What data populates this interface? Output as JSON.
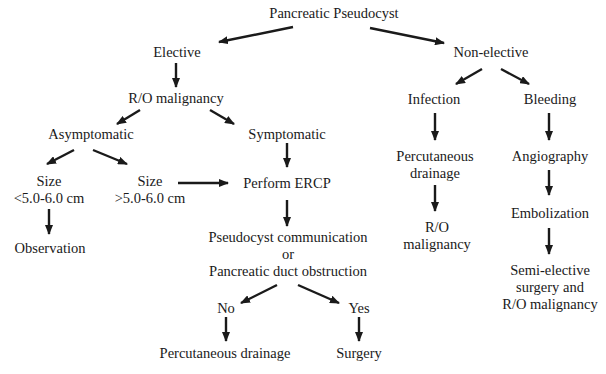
{
  "diagram": {
    "title": "Pancreatic Pseudocyst",
    "nodes": {
      "root": {
        "lines": [
          "Pancreatic Pseudocyst"
        ]
      },
      "elective": {
        "lines": [
          "Elective"
        ]
      },
      "non_elective": {
        "lines": [
          "Non-elective"
        ]
      },
      "ro_malignancy_1": {
        "lines": [
          "R/O malignancy"
        ]
      },
      "asymptomatic": {
        "lines": [
          "Asymptomatic"
        ]
      },
      "symptomatic": {
        "lines": [
          "Symptomatic"
        ]
      },
      "size_small": {
        "lines": [
          "Size",
          "<5.0-6.0 cm"
        ]
      },
      "size_large": {
        "lines": [
          "Size",
          ">5.0-6.0 cm"
        ]
      },
      "observation": {
        "lines": [
          "Observation"
        ]
      },
      "perform_ercp": {
        "lines": [
          "Perform ERCP"
        ]
      },
      "communication": {
        "lines": [
          "Pseudocyst communication",
          "or",
          "Pancreatic duct obstruction"
        ]
      },
      "no": {
        "lines": [
          "No"
        ]
      },
      "yes": {
        "lines": [
          "Yes"
        ]
      },
      "perc_drainage_2": {
        "lines": [
          "Percutaneous drainage"
        ]
      },
      "surgery": {
        "lines": [
          "Surgery"
        ]
      },
      "infection": {
        "lines": [
          "Infection"
        ]
      },
      "bleeding": {
        "lines": [
          "Bleeding"
        ]
      },
      "perc_drainage_1": {
        "lines": [
          "Percutaneous",
          "drainage"
        ]
      },
      "angiography": {
        "lines": [
          "Angiography"
        ]
      },
      "ro_malignancy_2": {
        "lines": [
          "R/O",
          "malignancy"
        ]
      },
      "embolization": {
        "lines": [
          "Embolization"
        ]
      },
      "semi_elective": {
        "lines": [
          "Semi-elective",
          "surgery and",
          "R/O malignancy"
        ]
      }
    },
    "edges": [
      {
        "from": "root",
        "to": "elective"
      },
      {
        "from": "root",
        "to": "non_elective"
      },
      {
        "from": "elective",
        "to": "ro_malignancy_1"
      },
      {
        "from": "ro_malignancy_1",
        "to": "asymptomatic"
      },
      {
        "from": "ro_malignancy_1",
        "to": "symptomatic"
      },
      {
        "from": "asymptomatic",
        "to": "size_small"
      },
      {
        "from": "asymptomatic",
        "to": "size_large"
      },
      {
        "from": "size_small",
        "to": "observation"
      },
      {
        "from": "size_large",
        "to": "perform_ercp"
      },
      {
        "from": "symptomatic",
        "to": "perform_ercp"
      },
      {
        "from": "perform_ercp",
        "to": "communication"
      },
      {
        "from": "communication",
        "to": "no"
      },
      {
        "from": "communication",
        "to": "yes"
      },
      {
        "from": "no",
        "to": "perc_drainage_2"
      },
      {
        "from": "yes",
        "to": "surgery"
      },
      {
        "from": "non_elective",
        "to": "infection"
      },
      {
        "from": "non_elective",
        "to": "bleeding"
      },
      {
        "from": "infection",
        "to": "perc_drainage_1"
      },
      {
        "from": "perc_drainage_1",
        "to": "ro_malignancy_2"
      },
      {
        "from": "bleeding",
        "to": "angiography"
      },
      {
        "from": "angiography",
        "to": "embolization"
      },
      {
        "from": "embolization",
        "to": "semi_elective"
      }
    ]
  }
}
